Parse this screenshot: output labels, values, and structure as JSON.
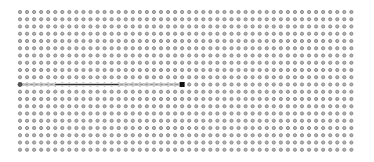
{
  "grid": {
    "origin_x": 20,
    "origin_y": 12,
    "cols": 48,
    "rows": 20,
    "step_x": 7.05,
    "step_y": 7.25,
    "dot_radius": 1.6,
    "dot_color": "#7a7a7a",
    "dot_fill": "#b4b4b4"
  },
  "stroke": {
    "row": 10,
    "start_col": 0,
    "end_col": 23,
    "line_color": "#9a9a9a",
    "dash_color": "#c8c8c8",
    "dark_segment_color": "#333333",
    "start_marker_color": "#555555",
    "end_marker_color": "#111111",
    "end_marker_size": 5
  }
}
